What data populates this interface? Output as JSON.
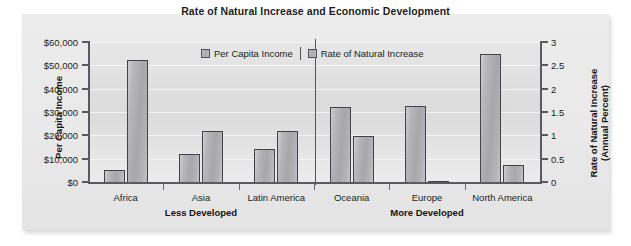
{
  "chart_data": {
    "type": "bar",
    "title": "Rate of Natural Increase and Economic Development",
    "categories": [
      "Africa",
      "Asia",
      "Latin America",
      "Oceania",
      "Europe",
      "North America"
    ],
    "series": [
      {
        "name": "Per Capita Income",
        "axis": "left",
        "values": [
          5000,
          12000,
          14000,
          32000,
          32500,
          55000
        ]
      },
      {
        "name": "Rate of Natural Increase",
        "axis": "right",
        "values": [
          2.62,
          1.1,
          1.1,
          0.99,
          0.02,
          0.37
        ]
      }
    ],
    "ylabel": "Per Capita Income",
    "ylabel_right": "Rate of Natural Increase (Annual Percent)",
    "ylabel_right_line1": "Rate of Natural Increase",
    "ylabel_right_line2": "(Annual Percent)",
    "xlabel": "",
    "ylim": [
      0,
      60000
    ],
    "ylim_right": [
      0,
      3
    ],
    "yticks_left": [
      "$0",
      "$10,000",
      "$20,000",
      "$30,000",
      "$40,000",
      "$50,000",
      "$60,000"
    ],
    "yticks_left_values": [
      0,
      10000,
      20000,
      30000,
      40000,
      50000,
      60000
    ],
    "yticks_right": [
      "0",
      "0.5",
      "1",
      "1.5",
      "2",
      "2.5",
      "3"
    ],
    "yticks_right_values": [
      0,
      0.5,
      1,
      1.5,
      2,
      2.5,
      3
    ],
    "grid": true,
    "legend_position": "top-center",
    "groups": [
      {
        "label": "Less Developed",
        "categories": [
          "Africa",
          "Asia",
          "Latin America"
        ]
      },
      {
        "label": "More Developed",
        "categories": [
          "Oceania",
          "Europe",
          "North America"
        ]
      }
    ],
    "colors": {
      "bar_fill": "#aeaeb3",
      "bar_edge": "#43434a",
      "panel_background": "#e9e9ea",
      "plot_background": "#dedede",
      "gridline": "#f4f4f5",
      "axis": "#5a5a60",
      "text": "#1c1c1c"
    }
  }
}
